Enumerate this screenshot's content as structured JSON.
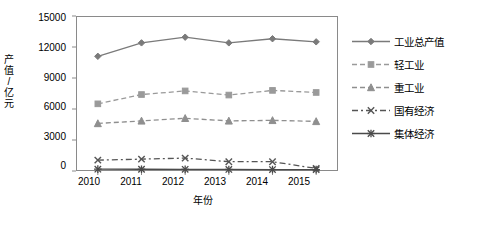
{
  "chart_data": {
    "type": "line",
    "title": "",
    "xlabel": "年份",
    "ylabel": "产值/亿元",
    "categories": [
      "2010",
      "2011",
      "2012",
      "2013",
      "2014",
      "2015"
    ],
    "yticks": [
      "0",
      "3000",
      "6000",
      "9000",
      "12000",
      "15000"
    ],
    "ylim": [
      0,
      15000
    ],
    "grid": false,
    "legend_position": "right",
    "series": [
      {
        "name": "工业总产值",
        "values": [
          11100,
          12400,
          12950,
          12400,
          12800,
          12500
        ],
        "color": "#7a7a7a",
        "marker": "diamond",
        "dash": "solid"
      },
      {
        "name": "轻工业",
        "values": [
          6500,
          7400,
          7750,
          7350,
          7800,
          7600
        ],
        "color": "#9a9a9a",
        "marker": "square",
        "dash": "dashed"
      },
      {
        "name": "重工业",
        "values": [
          4600,
          4850,
          5100,
          4850,
          4900,
          4800
        ],
        "color": "#8f8f8f",
        "marker": "triangle",
        "dash": "dashed"
      },
      {
        "name": "国有经济",
        "values": [
          1050,
          1150,
          1250,
          900,
          900,
          250
        ],
        "color": "#555555",
        "marker": "cross",
        "dash": "dashdot"
      },
      {
        "name": "集体经济",
        "values": [
          180,
          170,
          160,
          150,
          140,
          130
        ],
        "color": "#4a4a4a",
        "marker": "star",
        "dash": "solid"
      }
    ]
  },
  "axis": {
    "x_label": "年份",
    "y_label_chars": [
      "产",
      "值",
      "/",
      "亿",
      "元"
    ]
  }
}
